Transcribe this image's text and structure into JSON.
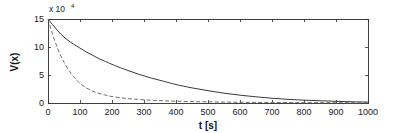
{
  "chart_data": {
    "type": "line",
    "title": "",
    "subtitle": "",
    "xlabel": "t [s]",
    "ylabel": "V(x)",
    "y_multiplier_text": "x 10",
    "y_multiplier_exponent": "4",
    "y_multiplier_value": 10000,
    "xlim": [
      0,
      1000
    ],
    "ylim": [
      0,
      15
    ],
    "xticks": [
      0,
      100,
      200,
      300,
      400,
      500,
      600,
      700,
      800,
      900,
      1000
    ],
    "xticklabels": [
      "0",
      "100",
      "200",
      "300",
      "400",
      "500",
      "600",
      "700",
      "800",
      "900",
      "1000"
    ],
    "yticks": [
      0,
      5,
      10,
      15
    ],
    "yticklabels": [
      "0",
      "5",
      "10",
      "15"
    ],
    "grid": false,
    "legend": "none",
    "box": true,
    "tick_direction": "in",
    "x": [
      0,
      20,
      40,
      60,
      80,
      100,
      120,
      140,
      160,
      180,
      200,
      240,
      280,
      320,
      360,
      400,
      450,
      500,
      550,
      600,
      650,
      700,
      750,
      800,
      850,
      900,
      950,
      1000
    ],
    "series": [
      {
        "name": "solid",
        "style": "solid",
        "color": "#3a3a3a",
        "values": [
          15.0,
          13.6,
          12.3,
          11.3,
          10.5,
          9.8,
          9.1,
          8.5,
          7.9,
          7.4,
          6.9,
          6.0,
          5.2,
          4.5,
          3.9,
          3.3,
          2.7,
          2.2,
          1.75,
          1.4,
          1.1,
          0.85,
          0.65,
          0.5,
          0.4,
          0.3,
          0.22,
          0.17
        ]
      },
      {
        "name": "dashed",
        "style": "dashed",
        "color": "#6e6e6e",
        "values": [
          15.0,
          11.3,
          8.4,
          6.3,
          4.7,
          3.5,
          2.7,
          2.1,
          1.7,
          1.4,
          1.15,
          0.85,
          0.65,
          0.5,
          0.4,
          0.32,
          0.25,
          0.2,
          0.16,
          0.13,
          0.11,
          0.09,
          0.08,
          0.07,
          0.06,
          0.05,
          0.05,
          0.04
        ]
      }
    ]
  }
}
